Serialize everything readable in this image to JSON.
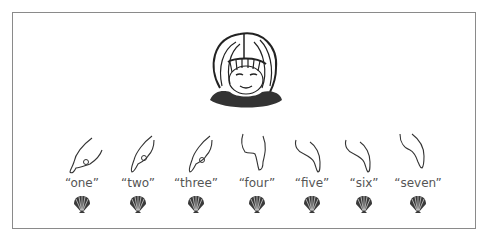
{
  "figure": {
    "face": {
      "icon": "child-face-looking-down-icon"
    },
    "items": [
      {
        "label": "“one”",
        "x": 82,
        "hand_icon": "pointing-hand-icon",
        "counter_icon": "scallop-shell-icon"
      },
      {
        "label": "“two”",
        "x": 138,
        "hand_icon": "pointing-hand-icon",
        "counter_icon": "scallop-shell-icon"
      },
      {
        "label": "“three”",
        "x": 196,
        "hand_icon": "pointing-hand-icon",
        "counter_icon": "scallop-shell-icon"
      },
      {
        "label": "“four”",
        "x": 257,
        "hand_icon": "pointing-hand-icon",
        "counter_icon": "scallop-shell-icon"
      },
      {
        "label": "“five”",
        "x": 312,
        "hand_icon": "pointing-hand-icon",
        "counter_icon": "scallop-shell-icon"
      },
      {
        "label": "“six”",
        "x": 364,
        "hand_icon": "pointing-hand-icon",
        "counter_icon": "scallop-shell-icon"
      },
      {
        "label": "“seven”",
        "x": 418,
        "hand_icon": "pointing-hand-icon",
        "counter_icon": "scallop-shell-icon"
      }
    ],
    "colors": {
      "frame": "#8a8a8a",
      "label": "#555555",
      "shell": "#3a3a3a",
      "ink": "#222222"
    }
  }
}
